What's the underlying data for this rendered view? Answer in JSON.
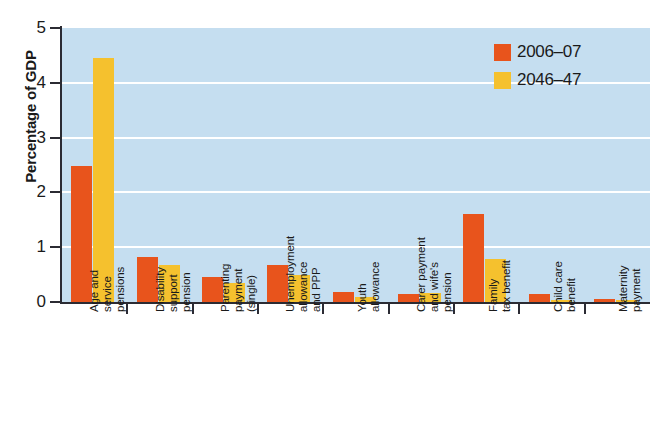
{
  "chart_data": {
    "type": "bar",
    "title": "",
    "xlabel": "",
    "ylabel": "Percentage of GDP",
    "ylim": [
      0,
      5
    ],
    "yticks": [
      "0",
      "1",
      "2",
      "3",
      "4",
      "5"
    ],
    "grid": true,
    "legend_position": "top-right",
    "categories": [
      "Age and service pensions",
      "Disability support pension",
      "Parenting payment (single)",
      "Unemployment allowance and PPP",
      "Youth allowance",
      "Carer payment and wife's pension",
      "Family tax benefit",
      "Child care benefit",
      "Maternity payment"
    ],
    "category_lines": [
      [
        "Age and",
        "service",
        "pensions"
      ],
      [
        "Disability",
        "support",
        "pension"
      ],
      [
        "Parenting",
        "payment",
        "(single)"
      ],
      [
        "Unemployment",
        "allowance",
        "and PPP"
      ],
      [
        "Youth",
        "allowance"
      ],
      [
        "Carer payment",
        "and wife's",
        "pension"
      ],
      [
        "Family",
        "tax benefit"
      ],
      [
        "Child care",
        "benefit"
      ],
      [
        "Maternity",
        "payment"
      ]
    ],
    "series": [
      {
        "name": "2006-07",
        "color": "#e8541c",
        "values": [
          2.48,
          0.82,
          0.46,
          0.67,
          0.18,
          0.14,
          1.6,
          0.15,
          0.05
        ]
      },
      {
        "name": "2046-47",
        "color": "#f5c12e",
        "values": [
          4.45,
          0.67,
          0.34,
          0.49,
          0.09,
          0.17,
          0.78,
          0.04,
          0.03
        ]
      }
    ]
  },
  "legend": {
    "items": [
      {
        "label": "2006–07",
        "color": "#e8541c"
      },
      {
        "label": "2046–47",
        "color": "#f5c12e"
      }
    ]
  },
  "colors": {
    "series_1": "#e8541c",
    "series_2": "#f5c12e",
    "plot_background": "#c5def0",
    "gridline": "#ffffff",
    "axis": "#2b2b33",
    "page_background": "#ffffff"
  }
}
